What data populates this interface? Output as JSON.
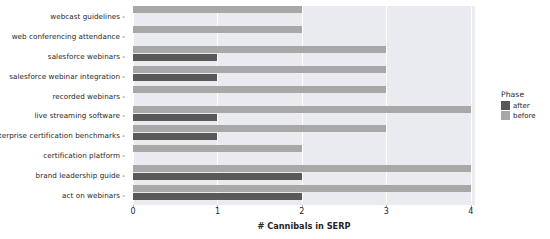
{
  "chart_data": {
    "type": "bar",
    "orientation": "horizontal",
    "title": "",
    "xlabel": "# Cannibals in SERP",
    "ylabel": "",
    "xlim": [
      0,
      4.05
    ],
    "xticks": [
      0,
      1,
      2,
      3,
      4
    ],
    "xticklabels": [
      "0",
      "1",
      "2",
      "3",
      "4"
    ],
    "grid": true,
    "grid_axis": "x",
    "legend": {
      "title": "Phase",
      "position": "right",
      "entries": [
        {
          "label": "after",
          "color": "#595959"
        },
        {
          "label": "before",
          "color": "#a8a8a8"
        }
      ]
    },
    "categories": [
      "webcast guidelines",
      "web conferencing attendance",
      "salesforce webinars",
      "salesforce webinar integration",
      "recorded webinars",
      "live streaming software",
      "enterprise certification benchmarks",
      "certification platform",
      "brand leadership guide",
      "act on webinars"
    ],
    "series": [
      {
        "name": "before",
        "color": "#a8a8a8",
        "values": [
          2,
          2,
          3,
          3,
          3,
          4,
          3,
          2,
          4,
          4
        ]
      },
      {
        "name": "after",
        "color": "#595959",
        "values": [
          0,
          0,
          1,
          1,
          0,
          1,
          1,
          0,
          2,
          2
        ]
      }
    ],
    "plot_background": "#eaeaf1",
    "grid_color": "#ffffff",
    "text_color": "#262626"
  }
}
